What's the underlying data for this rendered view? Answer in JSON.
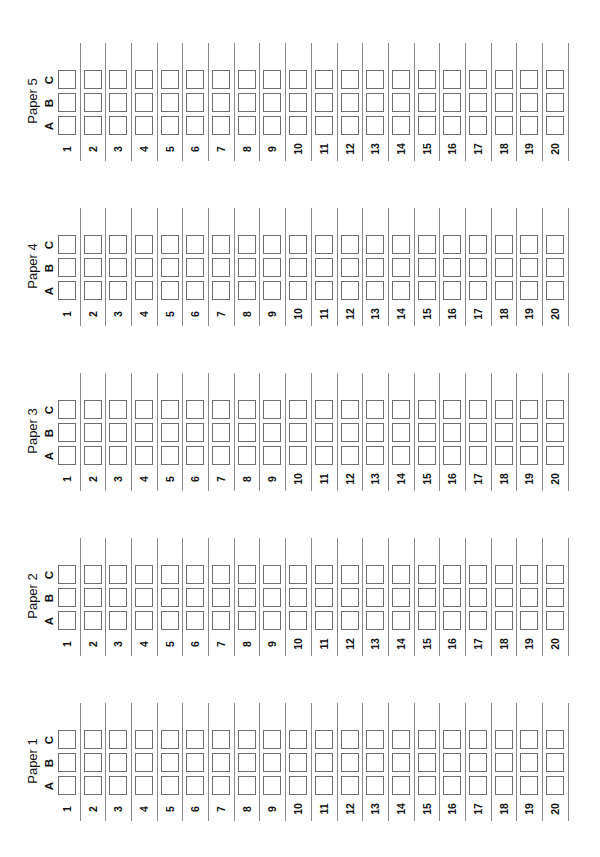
{
  "document": {
    "type": "answer-sheet",
    "orientation": "rotated-90-ccw",
    "colors": {
      "background": "#ffffff",
      "grid_line": "#8a8a8a",
      "box_border": "#6e6e6e",
      "text": "#111111"
    }
  },
  "options": [
    "A",
    "B",
    "C"
  ],
  "questions": [
    "1",
    "2",
    "3",
    "4",
    "5",
    "6",
    "7",
    "8",
    "9",
    "10",
    "11",
    "12",
    "13",
    "14",
    "15",
    "16",
    "17",
    "18",
    "19",
    "20"
  ],
  "papers": [
    {
      "title": "Paper 5",
      "number": 5
    },
    {
      "title": "Paper 4",
      "number": 4
    },
    {
      "title": "Paper 3",
      "number": 3
    },
    {
      "title": "Paper 2",
      "number": 2
    },
    {
      "title": "Paper 1",
      "number": 1
    }
  ],
  "layout": {
    "paper_tops": [
      43,
      208,
      373,
      538,
      703
    ],
    "first_line_x": 79.5,
    "column_pitch": 25.7,
    "line_height": 118
  }
}
